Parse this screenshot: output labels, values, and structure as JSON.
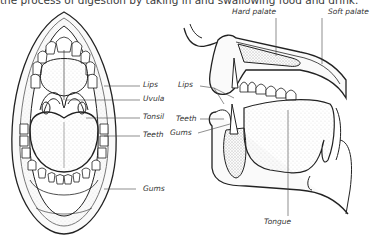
{
  "caption": "the process of digestion by taking in and swallowing food and drink.",
  "front_view": {
    "name": "open mouth front view",
    "labels": [
      {
        "key": "lips",
        "text": "Lips"
      },
      {
        "key": "uvula",
        "text": "Uvula"
      },
      {
        "key": "tonsil",
        "text": "Tonsil"
      },
      {
        "key": "teeth",
        "text": "Teeth"
      },
      {
        "key": "gums",
        "text": "Gums"
      }
    ]
  },
  "side_view": {
    "name": "mouth cross-section side view",
    "labels": [
      {
        "key": "hard_palate",
        "text": "Hard palate"
      },
      {
        "key": "soft_palate",
        "text": "Soft palate"
      },
      {
        "key": "lips",
        "text": "Lips"
      },
      {
        "key": "teeth",
        "text": "Teeth"
      },
      {
        "key": "gums",
        "text": "Gums"
      },
      {
        "key": "tongue",
        "text": "Tongue"
      }
    ]
  }
}
